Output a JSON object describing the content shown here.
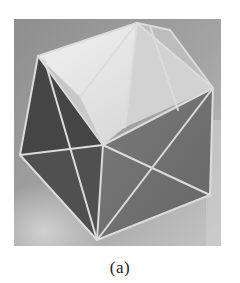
{
  "figure": {
    "caption": "(a)",
    "image_description": "Photograph of a translucent polyhedron model with light edges on a gray backdrop",
    "colors": {
      "background": "#9a9a9a",
      "top_face_light": "#e6e6e6",
      "dark_face": "#4a4a4a",
      "mid_face": "#6e6e6e",
      "edge": "#d8d8d8"
    }
  }
}
